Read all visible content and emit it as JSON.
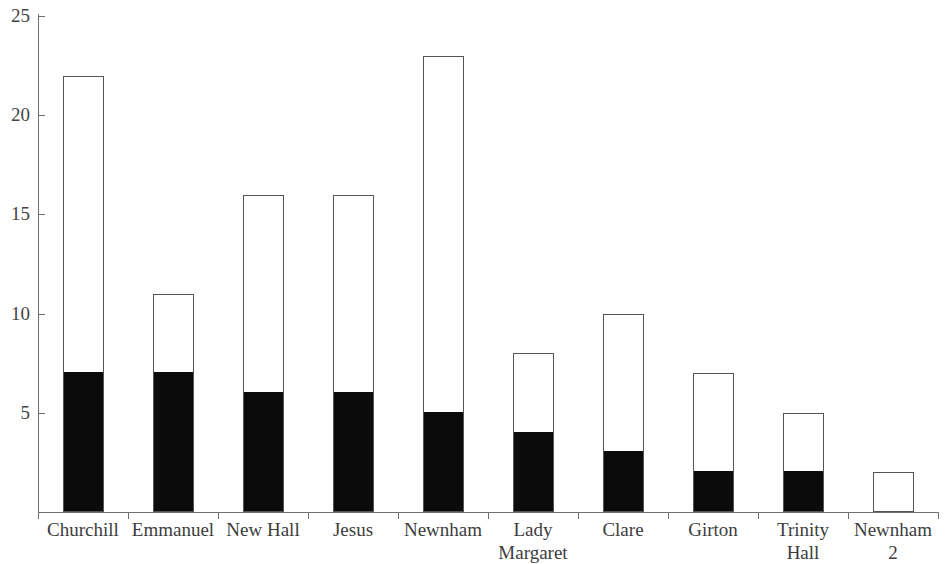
{
  "chart_data": {
    "type": "bar",
    "stacked": true,
    "title": "",
    "subtitle": "",
    "xlabel": "",
    "ylabel": "",
    "ylim": [
      0,
      25
    ],
    "yticks": [
      5,
      10,
      15,
      20,
      25
    ],
    "ytick_labels": [
      "5",
      "10",
      "15",
      "20",
      "25"
    ],
    "grid": false,
    "legend": "none",
    "categories": [
      "Churchill",
      "Emmanuel",
      "New Hall",
      "Jesus",
      "Newnham",
      "Lady\nMargaret",
      "Clare",
      "Girton",
      "Trinity\nHall",
      "Newnham\n2"
    ],
    "series": [
      {
        "name": "black-segment",
        "color": "#0b0b0b",
        "values": [
          7,
          7,
          6,
          6,
          5,
          4,
          3,
          2,
          2,
          0
        ]
      },
      {
        "name": "white-segment",
        "color": "#ffffff",
        "values": [
          15,
          4,
          10,
          10,
          18,
          4,
          7,
          5,
          3,
          2
        ]
      }
    ],
    "totals": [
      22,
      11,
      16,
      16,
      23,
      8,
      10,
      7,
      5,
      2
    ],
    "axis_color": "#6f6f6f",
    "bar_outline_color": "#555555"
  }
}
